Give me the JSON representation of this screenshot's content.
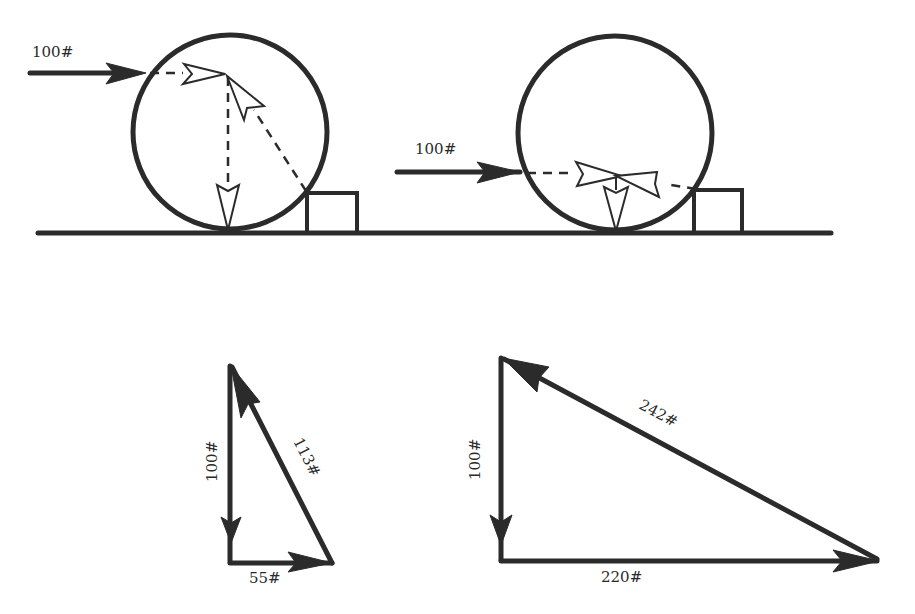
{
  "figure": {
    "ink_color": "#2b2b2b",
    "background_color": "#ffffff"
  },
  "top_left_case": {
    "applied_force_label": "100#",
    "applied_force_direction": "horizontal, to the right, applied high on wheel",
    "components": [
      "applied force (dashed, horizontal)",
      "weight (dashed, vertical down)",
      "reaction from block corner (dashed, diagonal)"
    ]
  },
  "top_right_case": {
    "applied_force_label": "100#",
    "applied_force_direction": "horizontal, to the right, applied low on wheel",
    "components": [
      "applied force (dashed, horizontal)",
      "weight (vertical down)",
      "reaction from block corner (dashed, near-horizontal)"
    ]
  },
  "bottom_left_triangle": {
    "vertical_label": "100#",
    "horizontal_label": "55#",
    "hypotenuse_label": "113#"
  },
  "bottom_right_triangle": {
    "vertical_label": "100#",
    "horizontal_label": "220#",
    "hypotenuse_label": "242#"
  }
}
